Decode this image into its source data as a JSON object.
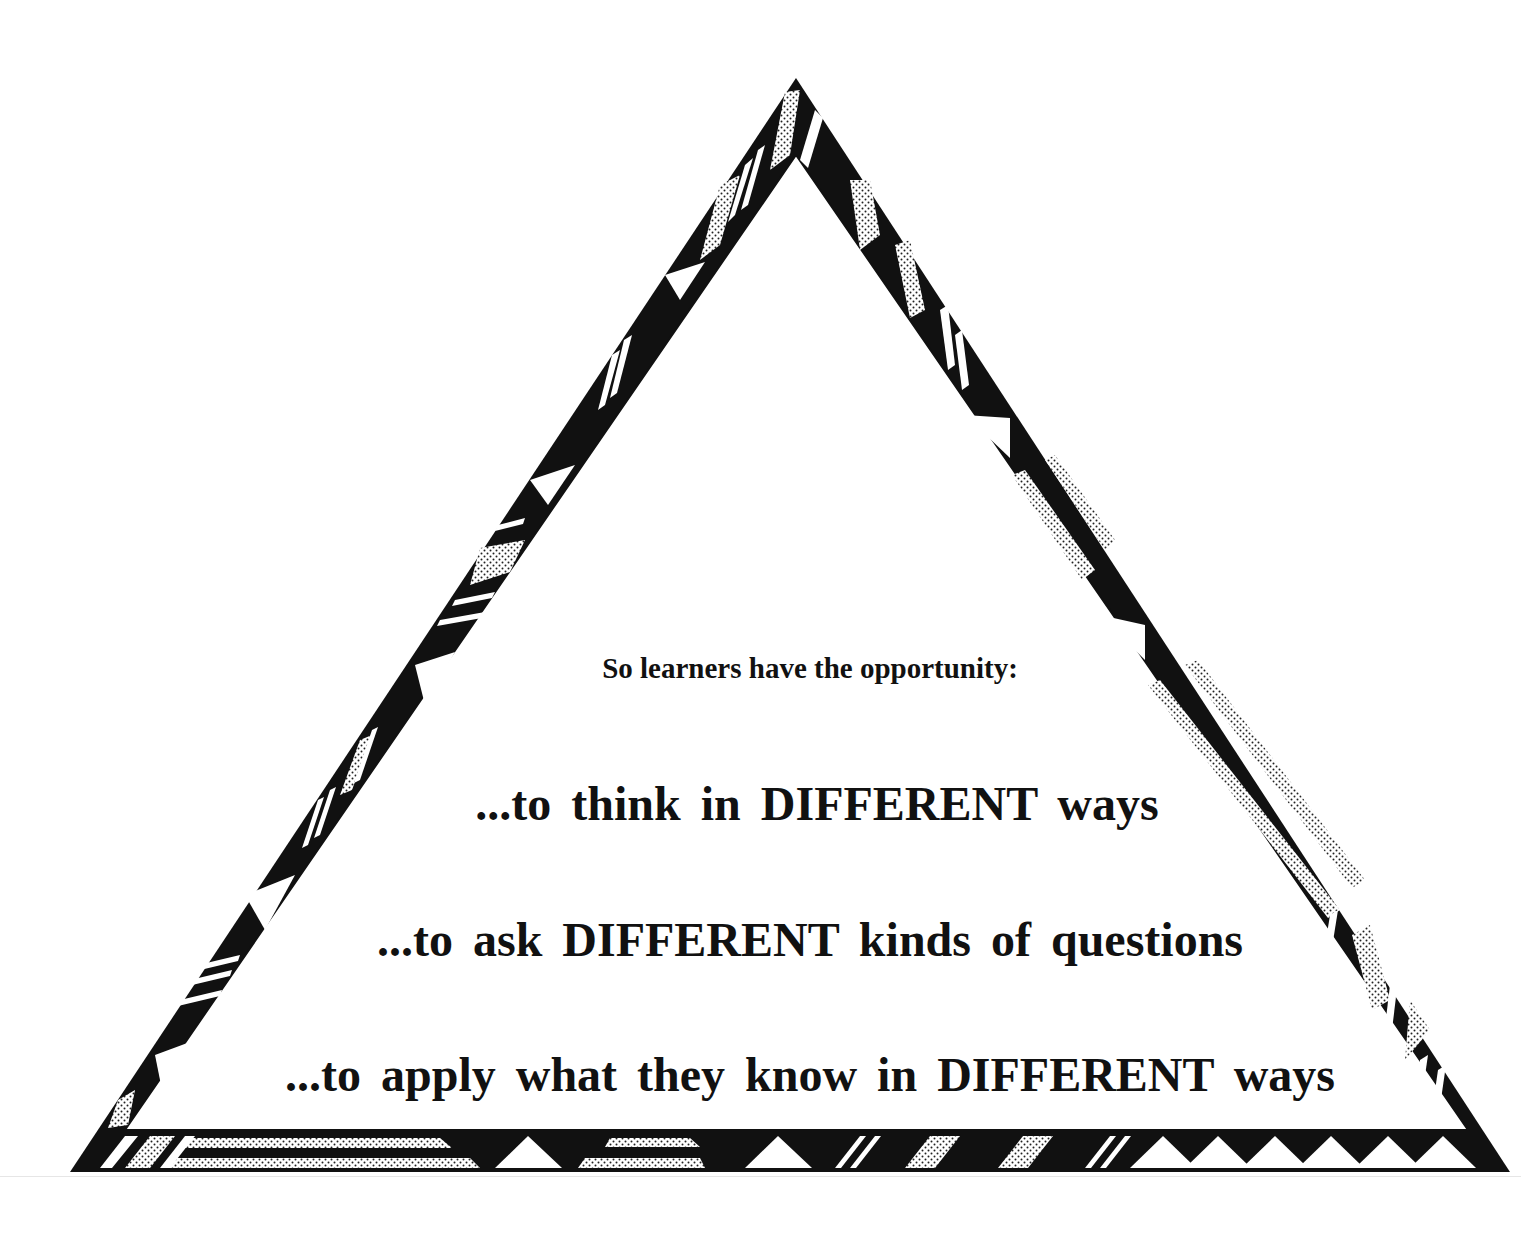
{
  "diagram": {
    "shape": "triangle",
    "border_style": "patterned band with black, white stripes, stippled gray segments and white triangles",
    "colors": {
      "ink": "#111111",
      "paper": "#ffffff",
      "stipple": "#9a9a9a"
    },
    "intro": "So learners have the opportunity:",
    "lines": [
      "...to think in DIFFERENT ways",
      "...to ask DIFFERENT kinds of questions",
      "...to apply what they know in DIFFERENT ways"
    ]
  }
}
